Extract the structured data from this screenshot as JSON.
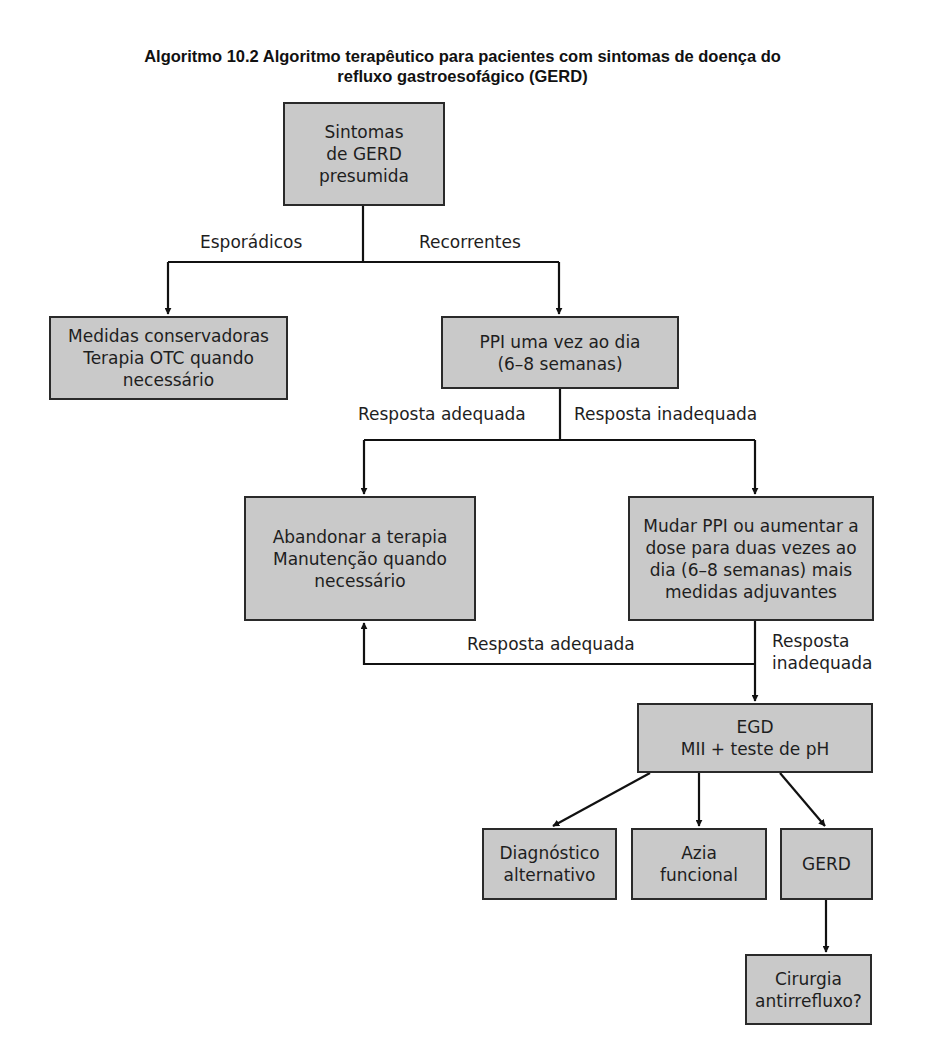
{
  "title": {
    "line1": "Algoritmo 10.2 Algoritmo terapêutico para pacientes com sintomas de doença do",
    "line2": "refluxo gastroesofágico (GERD)"
  },
  "colors": {
    "box_fill": "#c9c9c9",
    "box_border": "#2a2a2a",
    "line": "#111111"
  },
  "nodes": {
    "start": "Sintomas\nde GERD\npresumida",
    "conservative": "Medidas conservadoras\nTerapia OTC quando\nnecessário",
    "ppi_once": "PPI uma vez ao dia\n(6–8 semanas)",
    "stop_therapy": "Abandonar a terapia\nManutenção quando\nnecessário",
    "change_ppi": "Mudar PPI ou aumentar a\ndose para duas vezes ao\ndia (6–8 semanas) mais\nmedidas adjuvantes",
    "egd": "EGD\nMII + teste de pH",
    "alt_diagnosis": "Diagnóstico\nalternativo",
    "functional_heartburn": "Azia\nfuncional",
    "gerd": "GERD",
    "surgery": "Cirurgia\nantirrefluxo?"
  },
  "edges": {
    "sporadic": "Esporádicos",
    "recurrent": "Recorrentes",
    "adequate_1": "Resposta adequada",
    "inadequate_1": "Resposta inadequada",
    "adequate_2": "Resposta adequada",
    "inadequate_2": "Resposta\ninadequada"
  }
}
